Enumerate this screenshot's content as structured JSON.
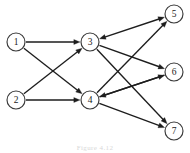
{
  "figure": {
    "caption": "Figure 4.12",
    "background_color": "#ffffff",
    "node_stroke_color": "#3a3a3a",
    "node_fill_color": "#ffffff",
    "edge_color": "#1d1d1d",
    "label_color": "#1b1b1b"
  },
  "graph": {
    "layout": "layered-left-to-right",
    "node_radius": 9,
    "nodes": [
      {
        "id": "1",
        "label": "1",
        "x": 16,
        "y": 42,
        "layer": 0
      },
      {
        "id": "2",
        "label": "2",
        "x": 16,
        "y": 100,
        "layer": 0
      },
      {
        "id": "3",
        "label": "3",
        "x": 90,
        "y": 42,
        "layer": 1
      },
      {
        "id": "4",
        "label": "4",
        "x": 90,
        "y": 100,
        "layer": 1
      },
      {
        "id": "5",
        "label": "5",
        "x": 174,
        "y": 14,
        "layer": 2
      },
      {
        "id": "6",
        "label": "6",
        "x": 174,
        "y": 72,
        "layer": 2
      },
      {
        "id": "7",
        "label": "7",
        "x": 174,
        "y": 131,
        "layer": 2
      }
    ],
    "edges": [
      {
        "from": "1",
        "to": "3",
        "arrow": "forward"
      },
      {
        "from": "1",
        "to": "4",
        "arrow": "forward"
      },
      {
        "from": "2",
        "to": "3",
        "arrow": "forward"
      },
      {
        "from": "2",
        "to": "4",
        "arrow": "forward"
      },
      {
        "from": "3",
        "to": "5",
        "arrow": "both"
      },
      {
        "from": "3",
        "to": "6",
        "arrow": "forward"
      },
      {
        "from": "3",
        "to": "7",
        "arrow": "forward"
      },
      {
        "from": "4",
        "to": "5",
        "arrow": "forward"
      },
      {
        "from": "4",
        "to": "6",
        "arrow": "forward"
      },
      {
        "from": "4",
        "to": "7",
        "arrow": "forward"
      },
      {
        "from": "6",
        "to": "4",
        "arrow": "forward"
      }
    ]
  }
}
